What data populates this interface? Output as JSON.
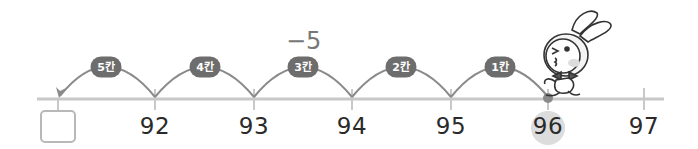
{
  "operation_label": "−5",
  "number_line": {
    "ticks": [
      {
        "label": "",
        "x": 58,
        "is_answer_box": true
      },
      {
        "label": "92",
        "x": 155
      },
      {
        "label": "93",
        "x": 254
      },
      {
        "label": "94",
        "x": 352
      },
      {
        "label": "95",
        "x": 451
      },
      {
        "label": "96",
        "x": 548,
        "highlighted": true,
        "start_point": true
      },
      {
        "label": "97",
        "x": 644
      }
    ],
    "jumps": [
      {
        "badge": "1칸",
        "from_x": 548,
        "to_x": 451
      },
      {
        "badge": "2칸",
        "from_x": 451,
        "to_x": 352
      },
      {
        "badge": "3칸",
        "from_x": 352,
        "to_x": 254
      },
      {
        "badge": "4칸",
        "from_x": 254,
        "to_x": 155
      },
      {
        "badge": "5칸",
        "from_x": 155,
        "to_x": 58,
        "arrow": true
      }
    ]
  },
  "answer_box": {
    "value": ""
  },
  "labels": {
    "n92": "92",
    "n93": "93",
    "n94": "94",
    "n95": "95",
    "n96": "96",
    "n97": "97",
    "b1": "1칸",
    "b2": "2칸",
    "b3": "3칸",
    "b4": "4칸",
    "b5": "5칸"
  },
  "colors": {
    "axis": "#c8c8c8",
    "arc": "#8a8a8a",
    "badge": "#6d6d6d",
    "highlight": "#dcdcdc",
    "start_dot": "#8a8a8a"
  },
  "character": "bunny-mascot"
}
